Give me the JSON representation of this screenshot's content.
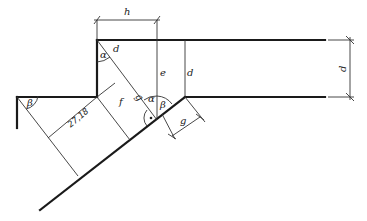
{
  "diagram": {
    "type": "technical-drawing",
    "labels": {
      "h": "h",
      "d_top_right": "d",
      "d_inner": "d",
      "d_diag": "d",
      "e": "e",
      "f": "f",
      "g_diag": "g",
      "g_dim": "g",
      "alpha_top": "α",
      "alpha_mid": "α",
      "beta_left": "β",
      "beta_mid": "β",
      "dimension_value": "27,18"
    },
    "colors": {
      "line": "#1a1a1a",
      "background": "#ffffff"
    }
  }
}
